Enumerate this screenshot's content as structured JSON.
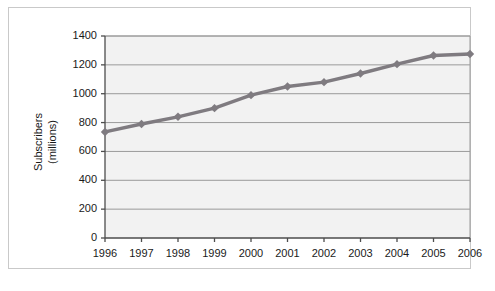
{
  "chart_data": {
    "type": "line",
    "title": "",
    "xlabel": "",
    "ylabel": "Subscribers (millions)",
    "ylabel_line1": "Subscribers",
    "ylabel_line2": "(millions)",
    "categories": [
      "1996",
      "1997",
      "1998",
      "1999",
      "2000",
      "2001",
      "2002",
      "2003",
      "2004",
      "2005",
      "2006"
    ],
    "values": [
      735,
      790,
      840,
      900,
      990,
      1050,
      1080,
      1140,
      1205,
      1265,
      1275
    ],
    "series": [
      {
        "name": "Subscribers",
        "values": [
          735,
          790,
          840,
          900,
          990,
          1050,
          1080,
          1140,
          1205,
          1265,
          1275
        ]
      }
    ],
    "ylim": [
      0,
      1400
    ],
    "yticks": [
      0,
      200,
      400,
      600,
      800,
      1000,
      1200,
      1400
    ],
    "ytick_labels": [
      "0",
      "200",
      "400",
      "600",
      "800",
      "1000",
      "1200",
      "1400"
    ],
    "xtick_labels": [
      "1996",
      "1997",
      "1998",
      "1999",
      "2000",
      "2001",
      "2002",
      "2003",
      "2004",
      "2005",
      "2006"
    ],
    "grid": "horizontal",
    "legend": "none",
    "marker": "diamond",
    "colors": {
      "line": "#7f7b80",
      "marker": "#7f7b80",
      "grid": "#9a9a9a",
      "axis": "#4d4d4d",
      "plot_background": "#f2f2f2",
      "figure_background": "#ffffff",
      "frame_border": "#c9c9c9",
      "text": "#1a1a1a"
    }
  }
}
